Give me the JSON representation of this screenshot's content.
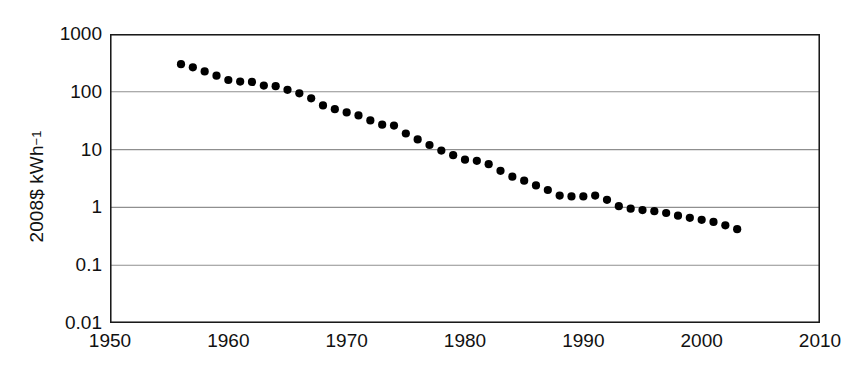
{
  "chart": {
    "type": "scatter",
    "title": "",
    "ylabel_text": "2008$ kWh",
    "ylabel_exponent": "−1",
    "ylabel_full": "2008$ kWh−1",
    "xlabel": "",
    "marker_color": "#000000",
    "axis_color": "#1a1a1a",
    "grid_color": "#8f8f8f",
    "background": "#ffffff",
    "grid": true,
    "legend": "none",
    "yscale": "log",
    "ylim": [
      0.01,
      1000
    ],
    "xlim": [
      1950,
      2010
    ],
    "ytick_labels": [
      "1000",
      "100",
      "10",
      "1",
      "0.1",
      "0.01"
    ],
    "ytick_values": [
      1000,
      100,
      10,
      1,
      0.1,
      0.01
    ],
    "xtick_labels": [
      "1950",
      "1960",
      "1970",
      "1980",
      "1990",
      "2000",
      "2010"
    ],
    "xtick_values": [
      1950,
      1960,
      1970,
      1980,
      1990,
      2000,
      2010
    ]
  },
  "chart_data": {
    "type": "scatter",
    "title": "",
    "xlabel": "",
    "ylabel": "2008$ kWh−1",
    "xlim": [
      1950,
      2010
    ],
    "ylim": [
      0.01,
      1000
    ],
    "yscale": "log",
    "grid": true,
    "legend_position": "none",
    "series": [
      {
        "name": "2008$ kWh-1",
        "marker": "circle",
        "color": "#000000",
        "x": [
          1956,
          1957,
          1958,
          1959,
          1960,
          1961,
          1962,
          1963,
          1964,
          1965,
          1966,
          1967,
          1968,
          1969,
          1970,
          1971,
          1972,
          1973,
          1974,
          1975,
          1976,
          1977,
          1978,
          1979,
          1980,
          1981,
          1982,
          1983,
          1984,
          1985,
          1986,
          1987,
          1988,
          1989,
          1990,
          1991,
          1992,
          1993,
          1994,
          1995,
          1996,
          1997,
          1998,
          1999,
          2000,
          2001,
          2002,
          2003
        ],
        "y": [
          300,
          265,
          225,
          190,
          160,
          150,
          148,
          128,
          125,
          108,
          94,
          77,
          58,
          50,
          44,
          39,
          32,
          27,
          26,
          19,
          15,
          12,
          9.6,
          8.0,
          6.7,
          6.4,
          5.6,
          4.3,
          3.4,
          2.9,
          2.4,
          2.0,
          1.6,
          1.55,
          1.55,
          1.6,
          1.35,
          1.05,
          0.95,
          0.9,
          0.86,
          0.8,
          0.72,
          0.66,
          0.61,
          0.56,
          0.49,
          0.42
        ]
      }
    ]
  }
}
